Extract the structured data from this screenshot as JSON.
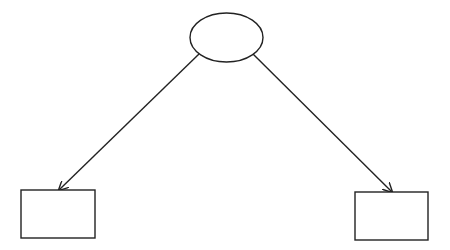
{
  "diagram": {
    "type": "tree",
    "stroke_color": "#222222",
    "fill_color": "#ffffff",
    "nodes": [
      {
        "id": "root",
        "shape": "ellipse",
        "label": "",
        "cx": 226.5,
        "cy": 37.5,
        "rx": 36.5,
        "ry": 24.5
      },
      {
        "id": "left-child",
        "shape": "rectangle",
        "label": "",
        "x": 21,
        "y": 190,
        "width": 74,
        "height": 48
      },
      {
        "id": "right-child",
        "shape": "rectangle",
        "label": "",
        "x": 355,
        "y": 192,
        "width": 73,
        "height": 48
      }
    ],
    "edges": [
      {
        "from": "root",
        "to": "left-child",
        "x1": 199,
        "y1": 54,
        "x2": 59,
        "y2": 190,
        "arrow": "end"
      },
      {
        "from": "root",
        "to": "right-child",
        "x1": 253,
        "y1": 54,
        "x2": 392,
        "y2": 192,
        "arrow": "end"
      }
    ]
  }
}
